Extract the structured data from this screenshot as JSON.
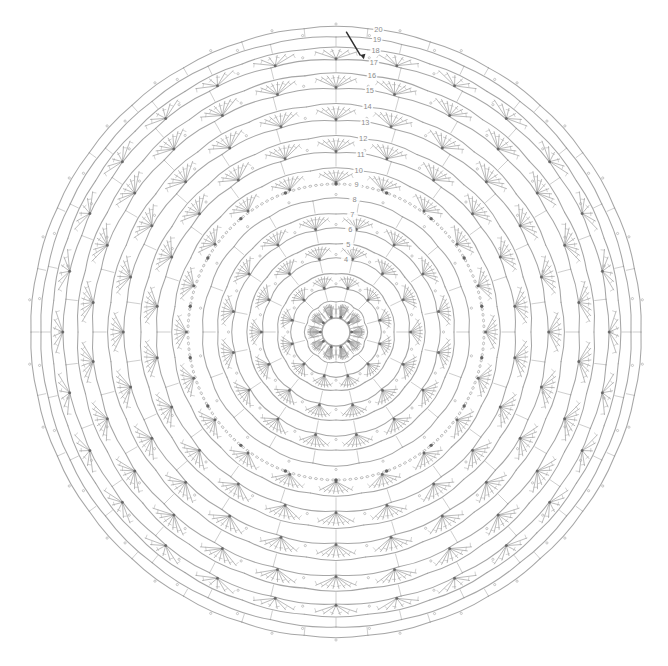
{
  "document": {
    "title": "Crochet Doily Pattern Chart",
    "type": "circular crochet stitch diagram",
    "background_color": "#ffffff",
    "line_color": "#9a9a9a",
    "label_color": "#8d8d8d",
    "start_marker_color": "#303030"
  },
  "canvas": {
    "width": 668,
    "height": 666,
    "center_x": 336,
    "center_y": 332,
    "outer_radius": 308
  },
  "chart_data": {
    "type": "diagram",
    "subtype": "radial-shell-crochet-chart",
    "center_ring": {
      "label": "magic ring",
      "radius": 14,
      "spoke_count": 28
    },
    "round_count": 20,
    "rounds": [
      {
        "number": 1,
        "label": "1",
        "radius": 30,
        "repeats": 10,
        "stitch": "fan",
        "label_radius": 0,
        "label_visible": false
      },
      {
        "number": 2,
        "label": "2",
        "radius": 44,
        "repeats": 12,
        "stitch": "arc",
        "label_radius": 0,
        "label_visible": false
      },
      {
        "number": 3,
        "label": "3",
        "radius": 58,
        "repeats": 12,
        "stitch": "fan",
        "label_radius": 0,
        "label_visible": false
      },
      {
        "number": 4,
        "label": "4",
        "radius": 73,
        "repeats": 14,
        "stitch": "arc",
        "label_radius": 73,
        "label_visible": true
      },
      {
        "number": 5,
        "label": "5",
        "radius": 88,
        "repeats": 14,
        "stitch": "fan",
        "label_radius": 88,
        "label_visible": true
      },
      {
        "number": 6,
        "label": "6",
        "radius": 103,
        "repeats": 16,
        "stitch": "arc",
        "label_radius": 103,
        "label_visible": true
      },
      {
        "number": 7,
        "label": "7",
        "radius": 118,
        "repeats": 16,
        "stitch": "fan",
        "label_radius": 118,
        "label_visible": true
      },
      {
        "number": 8,
        "label": "8",
        "radius": 133,
        "repeats": 18,
        "stitch": "arc",
        "label_radius": 133,
        "label_visible": true
      },
      {
        "number": 9,
        "label": "9",
        "radius": 148,
        "repeats": 18,
        "stitch": "chain",
        "label_radius": 148,
        "label_visible": true
      },
      {
        "number": 10,
        "label": "10",
        "radius": 163,
        "repeats": 20,
        "stitch": "fan",
        "label_radius": 163,
        "label_visible": true
      },
      {
        "number": 11,
        "label": "11",
        "radius": 179,
        "repeats": 20,
        "stitch": "arc",
        "label_radius": 179,
        "label_visible": true
      },
      {
        "number": 12,
        "label": "12",
        "radius": 195,
        "repeats": 22,
        "stitch": "fan",
        "label_radius": 195,
        "label_visible": true
      },
      {
        "number": 13,
        "label": "13",
        "radius": 211,
        "repeats": 22,
        "stitch": "arc",
        "label_radius": 211,
        "label_visible": true
      },
      {
        "number": 14,
        "label": "14",
        "radius": 227,
        "repeats": 24,
        "stitch": "fan",
        "label_radius": 227,
        "label_visible": true
      },
      {
        "number": 15,
        "label": "15",
        "radius": 243,
        "repeats": 24,
        "stitch": "arc",
        "label_radius": 243,
        "label_visible": true
      },
      {
        "number": 16,
        "label": "16",
        "radius": 258,
        "repeats": 26,
        "stitch": "fan",
        "label_radius": 258,
        "label_visible": true
      },
      {
        "number": 17,
        "label": "17",
        "radius": 272,
        "repeats": 26,
        "stitch": "arc",
        "label_radius": 272,
        "label_visible": true
      },
      {
        "number": 18,
        "label": "18",
        "radius": 284,
        "repeats": 28,
        "stitch": "fan",
        "label_radius": 284,
        "label_visible": true
      },
      {
        "number": 19,
        "label": "19",
        "radius": 295,
        "repeats": 28,
        "stitch": "arc",
        "label_radius": 295,
        "label_visible": true
      },
      {
        "number": 20,
        "label": "20",
        "radius": 305,
        "repeats": 30,
        "stitch": "arc",
        "label_radius": 305,
        "label_visible": true
      }
    ],
    "label_angle_degrees": -82,
    "start_marker": {
      "label": "start",
      "angle_degrees": -88,
      "radius": 300
    },
    "legend": [],
    "annotations": []
  }
}
